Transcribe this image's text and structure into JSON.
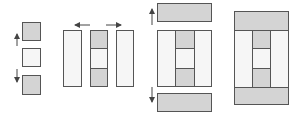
{
  "diagram": {
    "colors": {
      "fill_gray": "#d4d4d4",
      "fill_light": "#f6f6f6",
      "stroke": "#555555",
      "arrow": "#444444"
    },
    "panels": [
      {
        "id": "step-1",
        "label": "stacked tiles with vertical arrows",
        "tiles": [
          "gray",
          "light",
          "gray"
        ]
      },
      {
        "id": "step-2",
        "label": "center column with side columns and horizontal arrows",
        "tiles": [
          "light",
          "gray-light-gray",
          "light"
        ]
      },
      {
        "id": "step-3",
        "label": "grid with top and bottom bars and vertical arrows",
        "tiles": [
          "gray-bar",
          "grid",
          "gray-bar"
        ]
      },
      {
        "id": "step-4",
        "label": "combined final layout",
        "tiles": [
          "gray-top",
          "grid",
          "gray-bottom"
        ]
      }
    ]
  }
}
